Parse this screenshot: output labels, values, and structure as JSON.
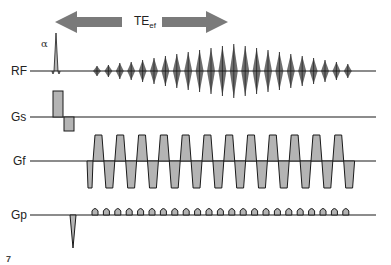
{
  "diagram": {
    "te_label": {
      "main": "TE",
      "sub": "ef"
    },
    "flip_label": "α",
    "figure_mark": "7",
    "rows": [
      {
        "id": "rf",
        "label": "RF",
        "baseline_y": 71
      },
      {
        "id": "gs",
        "label": "Gs",
        "baseline_y": 117
      },
      {
        "id": "gf",
        "label": "Gf",
        "baseline_y": 161
      },
      {
        "id": "gp",
        "label": "Gp",
        "baseline_y": 215
      }
    ],
    "line_start_x": 30,
    "line_end_x": 376,
    "colors": {
      "line": "#1a1a1a",
      "fill": "#b4b4b4",
      "arrow": "#7a7a7a",
      "echo": "#555555"
    },
    "arrow": {
      "left_tip_x": 55,
      "right_tip_x": 228,
      "y": 22,
      "gap_start_x": 122,
      "gap_end_x": 162
    },
    "rf_pulse": {
      "x": 56,
      "height": 38
    },
    "echoes": {
      "start_x": 97,
      "spacing": 11.4,
      "count": 23,
      "amplitudes": [
        5,
        6,
        8,
        9,
        11,
        13,
        15,
        17,
        19,
        21,
        23,
        25,
        27,
        25,
        23,
        21,
        19,
        17,
        15,
        13,
        11,
        9,
        7
      ]
    },
    "gs_lobes": [
      {
        "x1": 53,
        "x2": 63,
        "top": 91
      },
      {
        "x1": 64,
        "x2": 74,
        "top": 131
      }
    ],
    "gf": {
      "prephase_x": 87,
      "start_x": 93,
      "period": 21.8,
      "count": 12,
      "top": 135,
      "bottom": 188
    },
    "gp": {
      "prephase_x": 73,
      "prephase_depth": 248,
      "blip_start_x": 95,
      "blip_spacing": 11.4,
      "blip_count": 23,
      "blip_height": 7
    }
  }
}
